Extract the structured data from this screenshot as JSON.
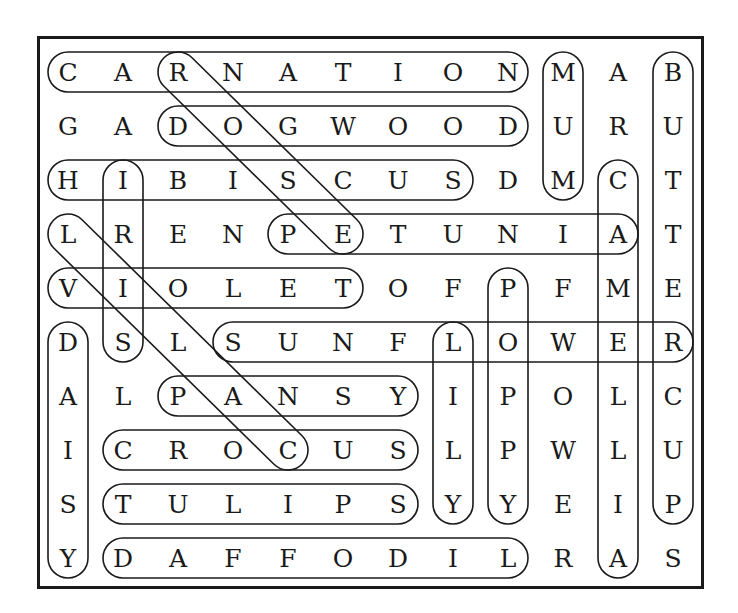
{
  "puzzle": {
    "type": "word-search",
    "rows": 10,
    "cols": 12,
    "grid": [
      [
        "C",
        "A",
        "R",
        "N",
        "A",
        "T",
        "I",
        "O",
        "N",
        "M",
        "A",
        "B"
      ],
      [
        "G",
        "A",
        "D",
        "O",
        "G",
        "W",
        "O",
        "O",
        "D",
        "U",
        "R",
        "U"
      ],
      [
        "H",
        "I",
        "B",
        "I",
        "S",
        "C",
        "U",
        "S",
        "D",
        "M",
        "C",
        "T"
      ],
      [
        "L",
        "R",
        "E",
        "N",
        "P",
        "E",
        "T",
        "U",
        "N",
        "I",
        "A",
        "T"
      ],
      [
        "V",
        "I",
        "O",
        "L",
        "E",
        "T",
        "O",
        "F",
        "P",
        "F",
        "M",
        "E"
      ],
      [
        "D",
        "S",
        "L",
        "S",
        "U",
        "N",
        "F",
        "L",
        "O",
        "W",
        "E",
        "R"
      ],
      [
        "A",
        "L",
        "P",
        "A",
        "N",
        "S",
        "Y",
        "I",
        "P",
        "O",
        "L",
        "C"
      ],
      [
        "I",
        "C",
        "R",
        "O",
        "C",
        "U",
        "S",
        "L",
        "P",
        "W",
        "L",
        "U"
      ],
      [
        "S",
        "T",
        "U",
        "L",
        "I",
        "P",
        "S",
        "Y",
        "Y",
        "E",
        "I",
        "P"
      ],
      [
        "Y",
        "D",
        "A",
        "F",
        "F",
        "O",
        "D",
        "I",
        "L",
        "R",
        "A",
        "S"
      ]
    ],
    "found_words": [
      {
        "word": "CARNATION",
        "start": [
          0,
          0
        ],
        "end": [
          0,
          8
        ]
      },
      {
        "word": "DOGWOOD",
        "start": [
          1,
          2
        ],
        "end": [
          1,
          8
        ]
      },
      {
        "word": "HIBISCUS",
        "start": [
          2,
          0
        ],
        "end": [
          2,
          7
        ]
      },
      {
        "word": "PETUNIA",
        "start": [
          3,
          4
        ],
        "end": [
          3,
          10
        ]
      },
      {
        "word": "VIOLET",
        "start": [
          4,
          0
        ],
        "end": [
          4,
          5
        ]
      },
      {
        "word": "SUNFLOWER",
        "start": [
          5,
          3
        ],
        "end": [
          5,
          11
        ]
      },
      {
        "word": "PANSY",
        "start": [
          6,
          2
        ],
        "end": [
          6,
          6
        ]
      },
      {
        "word": "CROCUS",
        "start": [
          7,
          1
        ],
        "end": [
          7,
          6
        ]
      },
      {
        "word": "TULIPS",
        "start": [
          8,
          1
        ],
        "end": [
          8,
          6
        ]
      },
      {
        "word": "DAFFODIL",
        "start": [
          9,
          1
        ],
        "end": [
          9,
          8
        ]
      },
      {
        "word": "MUM",
        "start": [
          0,
          9
        ],
        "end": [
          2,
          9
        ]
      },
      {
        "word": "BUTTERCUP",
        "start": [
          0,
          11
        ],
        "end": [
          8,
          11
        ]
      },
      {
        "word": "CAMELLIA",
        "start": [
          2,
          10
        ],
        "end": [
          9,
          10
        ]
      },
      {
        "word": "IRIS",
        "start": [
          2,
          1
        ],
        "end": [
          5,
          1
        ]
      },
      {
        "word": "DAISY",
        "start": [
          5,
          0
        ],
        "end": [
          9,
          0
        ]
      },
      {
        "word": "LILY",
        "start": [
          5,
          7
        ],
        "end": [
          8,
          7
        ]
      },
      {
        "word": "POPPY",
        "start": [
          4,
          8
        ],
        "end": [
          8,
          8
        ]
      },
      {
        "word": "ROSE",
        "start": [
          0,
          2
        ],
        "end": [
          3,
          5
        ]
      },
      {
        "word": "LILAC",
        "start": [
          3,
          0
        ],
        "end": [
          7,
          4
        ]
      }
    ]
  },
  "style": {
    "ink_color": "#1a1a1a",
    "background": "#ffffff"
  }
}
